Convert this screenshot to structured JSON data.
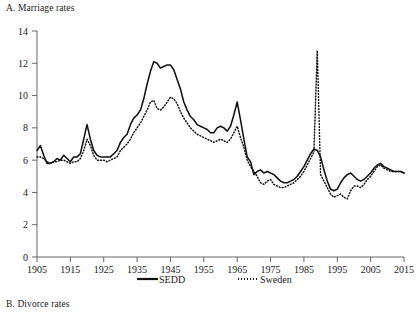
{
  "figure": {
    "panel_a_title": "A. Marriage rates",
    "panel_b_title": "B. Divorce rates"
  },
  "legend": {
    "entries": [
      {
        "label": "SEDD",
        "style": "solid-line",
        "color": "#111111"
      },
      {
        "label": "Sweden",
        "style": "dotted-line",
        "color": "#111111"
      }
    ]
  },
  "chart_data": {
    "type": "line",
    "title": "A. Marriage rates",
    "xlabel": "",
    "ylabel": "",
    "xlim": [
      1905,
      2015
    ],
    "ylim": [
      0,
      14
    ],
    "grid": false,
    "legend_position": "bottom",
    "xticks": [
      1905,
      1915,
      1925,
      1935,
      1945,
      1955,
      1965,
      1975,
      1985,
      1995,
      2005,
      2015
    ],
    "yticks": [
      0,
      2,
      4,
      6,
      8,
      10,
      12,
      14
    ],
    "x": [
      1905,
      1906,
      1907,
      1908,
      1909,
      1910,
      1911,
      1912,
      1913,
      1914,
      1915,
      1916,
      1917,
      1918,
      1919,
      1920,
      1921,
      1922,
      1923,
      1924,
      1925,
      1926,
      1927,
      1928,
      1929,
      1930,
      1931,
      1932,
      1933,
      1934,
      1935,
      1936,
      1937,
      1938,
      1939,
      1940,
      1941,
      1942,
      1943,
      1944,
      1945,
      1946,
      1947,
      1948,
      1949,
      1950,
      1951,
      1952,
      1953,
      1954,
      1955,
      1956,
      1957,
      1958,
      1959,
      1960,
      1961,
      1962,
      1963,
      1964,
      1965,
      1966,
      1967,
      1968,
      1969,
      1970,
      1971,
      1972,
      1973,
      1974,
      1975,
      1976,
      1977,
      1978,
      1979,
      1980,
      1981,
      1982,
      1983,
      1984,
      1985,
      1986,
      1987,
      1988,
      1989,
      1990,
      1991,
      1992,
      1993,
      1994,
      1995,
      1996,
      1997,
      1998,
      1999,
      2000,
      2001,
      2002,
      2003,
      2004,
      2005,
      2006,
      2007,
      2008,
      2009,
      2010,
      2011,
      2012,
      2013,
      2014,
      2015
    ],
    "series": [
      {
        "name": "SEDD",
        "style": "solid",
        "values": [
          6.6,
          6.9,
          6.3,
          5.8,
          5.8,
          5.9,
          6.1,
          6.0,
          6.3,
          6.1,
          5.9,
          6.2,
          6.2,
          6.4,
          7.3,
          8.2,
          7.3,
          6.6,
          6.3,
          6.2,
          6.2,
          6.2,
          6.2,
          6.4,
          6.6,
          7.1,
          7.4,
          7.6,
          8.2,
          8.6,
          8.8,
          9.1,
          9.8,
          10.7,
          11.5,
          12.1,
          12.0,
          11.7,
          11.8,
          11.9,
          11.9,
          11.6,
          11.0,
          10.4,
          9.6,
          9.1,
          8.7,
          8.5,
          8.2,
          8.1,
          8.0,
          7.9,
          7.7,
          7.7,
          8.0,
          8.1,
          8.0,
          7.8,
          8.1,
          8.8,
          9.6,
          8.5,
          7.3,
          6.2,
          5.9,
          5.1,
          5.3,
          5.4,
          5.2,
          5.3,
          5.2,
          5.1,
          4.9,
          4.7,
          4.6,
          4.6,
          4.7,
          4.8,
          5.0,
          5.3,
          5.6,
          6.0,
          6.4,
          6.7,
          6.6,
          6.2,
          5.4,
          4.7,
          4.2,
          4.1,
          4.2,
          4.6,
          4.9,
          5.1,
          5.2,
          5.0,
          4.8,
          4.7,
          4.8,
          5.0,
          5.2,
          5.5,
          5.7,
          5.8,
          5.6,
          5.5,
          5.4,
          5.3,
          5.3,
          5.3,
          5.2
        ]
      },
      {
        "name": "Sweden",
        "style": "dotted",
        "values": [
          6.2,
          6.2,
          6.1,
          5.9,
          5.8,
          5.9,
          5.9,
          6.0,
          6.0,
          5.9,
          5.8,
          5.9,
          5.9,
          6.1,
          6.6,
          7.3,
          6.9,
          6.3,
          6.0,
          6.0,
          6.0,
          5.9,
          6.0,
          6.1,
          6.2,
          6.6,
          6.8,
          7.0,
          7.3,
          7.7,
          8.0,
          8.3,
          8.7,
          9.1,
          9.6,
          9.7,
          9.2,
          9.1,
          9.3,
          9.6,
          9.9,
          9.8,
          9.5,
          9.0,
          8.6,
          8.3,
          8.0,
          7.8,
          7.6,
          7.5,
          7.4,
          7.3,
          7.2,
          7.1,
          7.2,
          7.3,
          7.2,
          7.1,
          7.3,
          7.7,
          8.1,
          7.4,
          6.8,
          6.0,
          5.6,
          5.3,
          5.0,
          4.6,
          4.5,
          4.7,
          4.8,
          4.5,
          4.4,
          4.3,
          4.3,
          4.4,
          4.5,
          4.6,
          4.8,
          5.0,
          5.3,
          5.7,
          6.1,
          6.5,
          12.8,
          5.1,
          4.7,
          4.3,
          3.9,
          3.7,
          3.8,
          3.9,
          3.7,
          3.6,
          4.1,
          4.4,
          4.4,
          4.3,
          4.5,
          4.8,
          5.0,
          5.3,
          5.6,
          5.7,
          5.5,
          5.4,
          5.3,
          5.3,
          5.3,
          5.3,
          5.2
        ]
      }
    ],
    "annotations": [
      {
        "text": "Sweden 1989 marriage spike",
        "x": 1989,
        "y": 12.8
      }
    ]
  }
}
